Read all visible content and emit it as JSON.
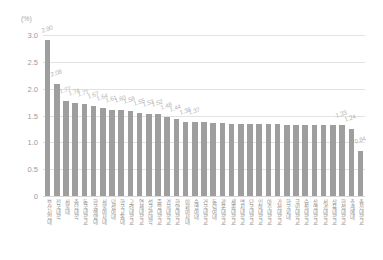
{
  "chart_data": {
    "type": "bar",
    "title": "",
    "subtitle": "",
    "unit_label": "(%)",
    "xlabel": "",
    "ylabel": "",
    "ylim": [
      0,
      3.0
    ],
    "yticks": [
      "3.0",
      "2.5",
      "2.0",
      "1.5",
      "1.0",
      "0.5",
      "0"
    ],
    "ytick_values": [
      3.0,
      2.5,
      2.0,
      1.5,
      1.0,
      0.5,
      0
    ],
    "grid": true,
    "legend": "none",
    "bar_color": "#9e9e9e",
    "label_color": "#b4b4b4",
    "axis_color": "#9a9a9a",
    "gridline_color": "#e2e2e2",
    "categories": [
      "부산시립대",
      "전국대학",
      "서울대",
      "충남대학",
      "동국대학교",
      "한국해양대",
      "서울여자대",
      "덕성여대",
      "한국교통대",
      "고려대학교",
      "연세대학교",
      "성균관대학",
      "중앙대학교",
      "경희대학교",
      "한양대학교",
      "이화여자대",
      "숙명여대",
      "건국대학교",
      "동덕여대",
      "광운대학교",
      "세종대학교",
      "명지대학교",
      "단국대학교",
      "인하대학교",
      "아주대학교",
      "가천대학교",
      "한국외대",
      "국민대학교",
      "숭실대학교",
      "상명대학교",
      "서경대학교",
      "삼육대학교",
      "한성대학교",
      "추계예대",
      "총신대학교"
    ],
    "values": [
      2.9,
      2.08,
      1.77,
      1.74,
      1.71,
      1.67,
      1.64,
      1.61,
      1.6,
      1.58,
      1.55,
      1.53,
      1.52,
      1.48,
      1.44,
      1.38,
      1.37,
      1.37,
      1.36,
      1.36,
      1.35,
      1.35,
      1.34,
      1.34,
      1.34,
      1.34,
      1.33,
      1.33,
      1.33,
      1.33,
      1.33,
      1.33,
      1.33,
      1.24,
      0.84
    ],
    "value_labels": [
      "2.90",
      "2.08",
      "1.77",
      "1.74",
      "1.71",
      "1.67",
      "1.64",
      "1.61",
      "1.60",
      "1.58",
      "1.55",
      "1.53",
      "1.52",
      "1.48",
      "1.44",
      "1.38",
      "1.37",
      "",
      "",
      "",
      "",
      "",
      "",
      "",
      "",
      "",
      "",
      "",
      "",
      "",
      "",
      "",
      "1.33",
      "1.24",
      "0.84"
    ]
  }
}
